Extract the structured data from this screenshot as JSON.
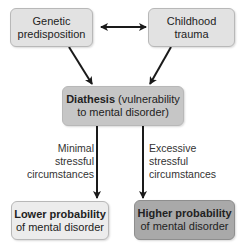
{
  "diagram": {
    "nodes": {
      "genetic": {
        "line1": "Genetic",
        "line2": "predisposition",
        "color": "#e2e2e2"
      },
      "trauma": {
        "line1": "Childhood",
        "line2": "trauma",
        "color": "#e2e2e2"
      },
      "diathesis": {
        "bold": "Diathesis",
        "line1_rest": " (vulnerability",
        "line2": "to mental disorder)",
        "color": "#c6c6c6"
      },
      "lower": {
        "bold": "Lower probability",
        "line2": "of mental disorder",
        "color": "#ececec"
      },
      "higher": {
        "bold": "Higher probability",
        "line2": "of mental disorder",
        "color": "#a9a9a9"
      }
    },
    "edge_labels": {
      "minimal": [
        "Minimal",
        "stressful",
        "circumstances"
      ],
      "excessive": [
        "Excessive",
        "stressful",
        "circumstances"
      ]
    },
    "edges": [
      {
        "from": "genetic",
        "to": "trauma",
        "type": "bidirectional"
      },
      {
        "from": "genetic",
        "to": "diathesis",
        "type": "directed"
      },
      {
        "from": "trauma",
        "to": "diathesis",
        "type": "directed"
      },
      {
        "from": "diathesis",
        "to": "lower",
        "label": "minimal"
      },
      {
        "from": "diathesis",
        "to": "higher",
        "label": "excessive"
      }
    ]
  }
}
